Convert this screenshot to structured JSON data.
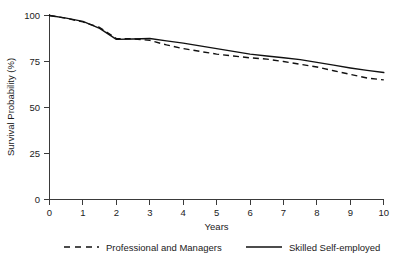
{
  "chart_data": {
    "type": "line",
    "title": "",
    "xlabel": "Years",
    "ylabel": "Survival Probability (%)",
    "xlim": [
      0,
      10
    ],
    "ylim": [
      0,
      100
    ],
    "xticks": [
      "0",
      "1",
      "2",
      "3",
      "4",
      "5",
      "6",
      "7",
      "8",
      "9",
      "10"
    ],
    "yticks": [
      "0",
      "25",
      "50",
      "75",
      "100"
    ],
    "grid": false,
    "legend_position": "bottom",
    "x": [
      0,
      0.5,
      1,
      1.5,
      2,
      2.5,
      3,
      3.5,
      4,
      4.5,
      5,
      5.5,
      6,
      6.5,
      7,
      7.5,
      8,
      8.5,
      9,
      9.5,
      10
    ],
    "series": [
      {
        "name": "Professional and Managers",
        "style": "dashed",
        "color": "#111111",
        "values": [
          100,
          98.5,
          96.5,
          93.5,
          87.5,
          87.3,
          86.5,
          84.0,
          82.0,
          80.5,
          79.0,
          78.0,
          77.0,
          76.3,
          75.0,
          73.5,
          72.0,
          70.0,
          68.0,
          66.0,
          65.0
        ]
      },
      {
        "name": "Skilled Self-employed",
        "style": "solid",
        "color": "#111111",
        "values": [
          100,
          98.6,
          96.8,
          93.0,
          87.0,
          87.2,
          87.5,
          86.2,
          85.0,
          83.5,
          82.0,
          80.5,
          79.0,
          78.0,
          77.0,
          76.0,
          74.5,
          73.0,
          71.5,
          70.2,
          69.0
        ]
      }
    ],
    "legend": [
      {
        "label": "Professional and Managers",
        "style": "dashed"
      },
      {
        "label": "Skilled Self-employed",
        "style": "solid"
      }
    ]
  }
}
